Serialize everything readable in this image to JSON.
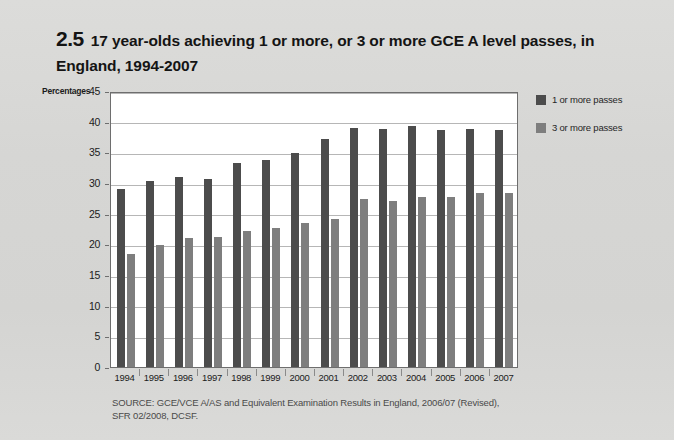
{
  "figure": {
    "number": "2.5",
    "title": "17 year-olds achieving 1 or more, or 3 or more GCE A level passes, in England, 1994-2007"
  },
  "legend": {
    "position": "right",
    "items": [
      {
        "label": "1 or more passes",
        "color": "#4c4c4c"
      },
      {
        "label": "3 or more passes",
        "color": "#7e7e7e"
      }
    ]
  },
  "source": {
    "line1": "SOURCE: GCE/VCE A/AS  and Equivalent Examination Results in England, 2006/07 (Revised),",
    "line2": "SFR 02/2008, DCSF."
  },
  "chart_data": {
    "type": "bar",
    "title": "17 year-olds achieving 1 or more, or 3 or more GCE A level passes, in England, 1994-2007",
    "xlabel": "",
    "ylabel": "Percentages",
    "ylim": [
      0,
      45
    ],
    "yticks": [
      0,
      5,
      10,
      15,
      20,
      25,
      30,
      35,
      40,
      45
    ],
    "grid": true,
    "legend_position": "right",
    "categories": [
      "1994",
      "1995",
      "1996",
      "1997",
      "1998",
      "1999",
      "2000",
      "2001",
      "2002",
      "2003",
      "2004",
      "2005",
      "2006",
      "2007"
    ],
    "series": [
      {
        "name": "1 or more passes",
        "color": "#4c4c4c",
        "values": [
          29.1,
          30.4,
          30.9,
          30.7,
          33.2,
          33.7,
          34.9,
          37.2,
          39.0,
          38.8,
          39.3,
          38.7,
          38.8,
          38.7
        ]
      },
      {
        "name": "3 or more passes",
        "color": "#7e7e7e",
        "values": [
          18.4,
          19.9,
          21.0,
          21.2,
          22.2,
          22.6,
          23.5,
          24.2,
          27.4,
          27.1,
          27.7,
          27.7,
          28.3,
          28.4
        ]
      }
    ]
  }
}
